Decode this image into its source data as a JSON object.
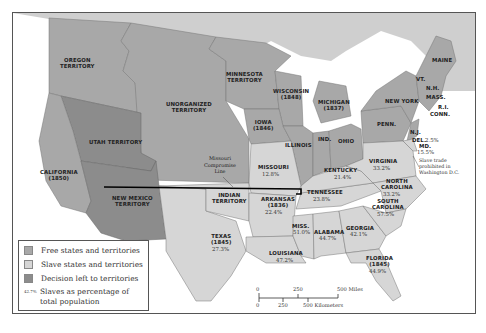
{
  "map": {
    "colors": {
      "free": "#a8a8a8",
      "slave": "#d6d6d6",
      "decision": "#8c8c8c",
      "water": "#ffffff",
      "canada": "#cfcfcf",
      "compromise_line": "#000000"
    },
    "regions": {
      "oregon": "OREGON\nTERRITORY",
      "minnesota": "MINNESOTA\nTERRITORY",
      "unorganized": "UNORGANIZED\nTERRITORY",
      "wisconsin": "WISCONSIN\n(1848)",
      "michigan": "MICHIGAN\n(1837)",
      "iowa": "IOWA\n(1846)",
      "illinois": "ILLINOIS",
      "indiana": "IND.",
      "ohio": "OHIO",
      "new_york": "NEW YORK",
      "penn": "PENN.",
      "maine": "MAINE",
      "vt": "VT.",
      "nh": "N.H.",
      "mass": "MASS.",
      "ri": "R.I.",
      "conn": "CONN.",
      "nj": "N.J.",
      "utah": "UTAH TERRITORY",
      "california": "CALIFORNIA\n(1850)",
      "new_mexico": "NEW MEXICO\nTERRITORY",
      "indian": "INDIAN\nTERRITORY",
      "missouri": "MISSOURI",
      "arkansas": "ARKANSAS\n(1836)",
      "texas": "TEXAS\n(1845)",
      "louisiana": "LOUISIANA",
      "miss": "MISS.",
      "alabama": "ALABAMA",
      "georgia": "GEORGIA",
      "florida": "FLORIDA\n(1845)",
      "tennessee": "TENNESSEE",
      "kentucky": "KENTUCKY",
      "virginia": "VIRGINIA",
      "north_carolina": "NORTH\nCAROLINA",
      "south_carolina": "SOUTH\nCAROLINA",
      "del": "DEL.",
      "md": "MD."
    },
    "percentages": {
      "missouri": "12.8%",
      "arkansas": "22.4%",
      "texas": "27.3%",
      "louisiana": "47.2%",
      "miss": "51.0%",
      "alabama": "44.7%",
      "georgia": "42.1%",
      "florida": "44.9%",
      "tennessee": "23.8%",
      "kentucky": "21.4%",
      "virginia": "33.2%",
      "north_carolina": "33.2%",
      "south_carolina": "57.5%",
      "del": "2.5%",
      "md": "15.5%"
    },
    "annotations": {
      "missouri_compromise": "Missouri\nCompromise\nLine",
      "dc_note": "Slave trade\nprohibited in\nWashington D.C."
    }
  },
  "legend": {
    "items": [
      {
        "label": "Free states and territories",
        "swatch": "#a8a8a8"
      },
      {
        "label": "Slave states and territories",
        "swatch": "#d6d6d6"
      },
      {
        "label": "Decision left to territories",
        "swatch": "#8c8c8c"
      }
    ],
    "pct_sample": "42.7%",
    "pct_label_line1": "Slaves as percentage of",
    "pct_label_line2": "total population"
  },
  "scale": {
    "miles_ticks": [
      "0",
      "250",
      "500 Miles"
    ],
    "km_ticks": [
      "0",
      "250",
      "500 Kilometers"
    ]
  }
}
